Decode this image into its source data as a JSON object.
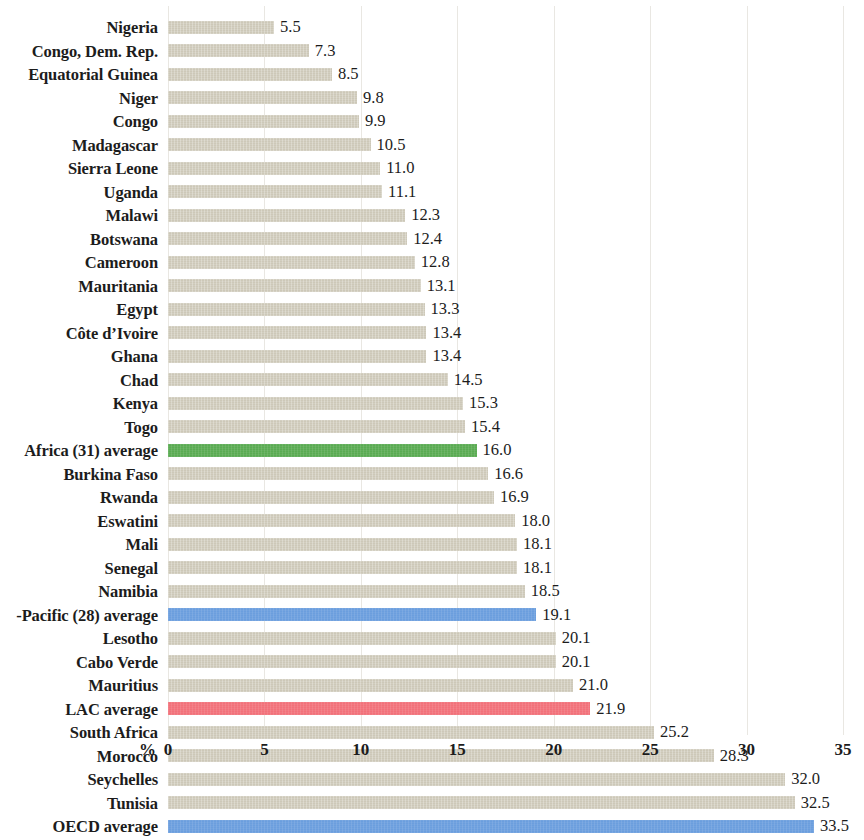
{
  "chart_data": {
    "type": "bar",
    "orientation": "horizontal",
    "title": "",
    "subtitle": "",
    "xlabel": "%",
    "ylabel": "",
    "xlim": [
      0,
      35
    ],
    "xticks": [
      0,
      5,
      10,
      15,
      20,
      25,
      30,
      35
    ],
    "xtick_labels": [
      "0",
      "5",
      "10",
      "15",
      "20",
      "25",
      "30",
      "35"
    ],
    "grid": true,
    "legend": "none",
    "value_label_format": "one decimal",
    "categories": [
      "Nigeria",
      "Congo, Dem. Rep.",
      "Equatorial Guinea",
      "Niger",
      "Congo",
      "Madagascar",
      "Sierra Leone",
      "Uganda",
      "Malawi",
      "Botswana",
      "Cameroon",
      "Mauritania",
      "Egypt",
      "Côte d’Ivoire",
      "Ghana",
      "Chad",
      "Kenya",
      "Togo",
      "Africa (31) average",
      "Burkina Faso",
      "Rwanda",
      "Eswatini",
      "Mali",
      "Senegal",
      "Namibia",
      "-Pacific (28) average",
      "Lesotho",
      "Cabo Verde",
      "Mauritius",
      "LAC average",
      "South Africa",
      "Morocco",
      "Seychelles",
      "Tunisia",
      "OECD average"
    ],
    "values": [
      5.5,
      7.3,
      8.5,
      9.8,
      9.9,
      10.5,
      11.0,
      11.1,
      12.3,
      12.4,
      12.8,
      13.1,
      13.3,
      13.4,
      13.4,
      14.5,
      15.3,
      15.4,
      16.0,
      16.6,
      16.9,
      18.0,
      18.1,
      18.1,
      18.5,
      19.1,
      20.1,
      20.1,
      21.0,
      21.9,
      25.2,
      28.3,
      32.0,
      32.5,
      33.5
    ],
    "value_labels": [
      "5.5",
      "7.3",
      "8.5",
      "9.8",
      "9.9",
      "10.5",
      "11.0",
      "11.1",
      "12.3",
      "12.4",
      "12.8",
      "13.1",
      "13.3",
      "13.4",
      "13.4",
      "14.5",
      "15.3",
      "15.4",
      "16.0",
      "16.6",
      "16.9",
      "18.0",
      "18.1",
      "18.1",
      "18.5",
      "19.1",
      "20.1",
      "20.1",
      "21.0",
      "21.9",
      "25.2",
      "28.3",
      "32.0",
      "32.5",
      "33.5"
    ],
    "bar_colors": [
      "default",
      "default",
      "default",
      "default",
      "default",
      "default",
      "default",
      "default",
      "default",
      "default",
      "default",
      "default",
      "default",
      "default",
      "default",
      "default",
      "default",
      "default",
      "green",
      "default",
      "default",
      "default",
      "default",
      "default",
      "default",
      "blue",
      "default",
      "default",
      "default",
      "red",
      "default",
      "default",
      "default",
      "default",
      "blue"
    ],
    "colors": {
      "default": "#cdc8b8",
      "green": "#5aab52",
      "blue": "#6b9ede",
      "red": "#f2717a",
      "gridline": "#e9e7e2",
      "text": "#1c1c1c",
      "background": "#ffffff"
    }
  }
}
